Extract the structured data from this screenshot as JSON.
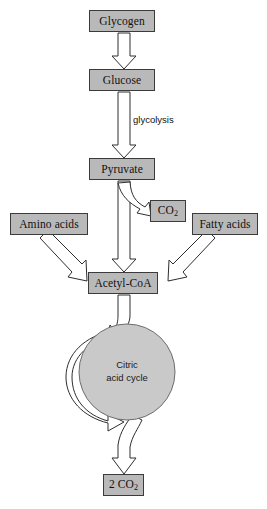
{
  "diagram": {
    "background_color": "#ffffff",
    "box_fill_color": "#b9b9b9",
    "box_border_color": "#3b3b3b",
    "arrow_fill_color": "#ffffff",
    "arrow_stroke_color": "#2e2e2e",
    "cycle_fill_color": "#c9c9c9"
  },
  "nodes": {
    "glycogen": {
      "label": "Glycogen",
      "x": 89,
      "y": 10,
      "w": 66,
      "h": 22
    },
    "glucose": {
      "label": "Glucose",
      "x": 89,
      "y": 69,
      "w": 66,
      "h": 22
    },
    "pyruvate": {
      "label": "Pyruvate",
      "x": 89,
      "y": 158,
      "w": 66,
      "h": 22
    },
    "co2": {
      "label": "CO",
      "sub": "2",
      "x": 150,
      "y": 200,
      "w": 36,
      "h": 22
    },
    "amino_acids": {
      "label": "Amino acids",
      "x": 10,
      "y": 213,
      "w": 78,
      "h": 22
    },
    "fatty_acids": {
      "label": "Fatty acids",
      "x": 192,
      "y": 213,
      "w": 66,
      "h": 22
    },
    "acetyl_coa": {
      "label": "Acetyl-CoA",
      "x": 88,
      "y": 272,
      "w": 70,
      "h": 22
    },
    "two_co2": {
      "label": "2 CO",
      "sub": "2",
      "x": 103,
      "y": 474,
      "w": 41,
      "h": 22
    }
  },
  "cycle": {
    "line1": "Citric",
    "line2": "acid cycle",
    "center_x": 127,
    "center_y": 372,
    "radius": 48
  },
  "edges": {
    "glycolysis_label": "glycolysis",
    "glycolysis_label_x": 133,
    "glycolysis_label_y": 114
  }
}
